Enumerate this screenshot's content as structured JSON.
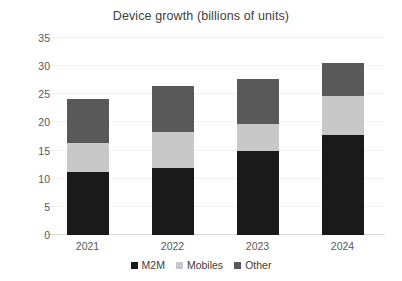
{
  "chart_data": {
    "type": "bar",
    "subtype": "stacked-column",
    "title": "Device growth (billions of units)",
    "xlabel": "",
    "ylabel": "",
    "categories": [
      "2021",
      "2022",
      "2023",
      "2024"
    ],
    "series": [
      {
        "name": "M2M",
        "color": "#1a1a1a",
        "values": [
          11.2,
          11.9,
          14.9,
          17.8
        ]
      },
      {
        "name": "Mobiles",
        "color": "#c8c8c8",
        "values": [
          5.1,
          6.4,
          4.8,
          6.9
        ]
      },
      {
        "name": "Other",
        "color": "#595959",
        "values": [
          7.9,
          8.2,
          8.0,
          5.9
        ]
      }
    ],
    "totals": [
      24.2,
      26.5,
      27.7,
      30.6
    ],
    "ylim": [
      0,
      35
    ],
    "yticks": [
      "0",
      "5",
      "10",
      "15",
      "20",
      "25",
      "30",
      "35"
    ],
    "ytick_values": [
      0,
      5,
      10,
      15,
      20,
      25,
      30,
      35
    ],
    "grid": true,
    "legend_position": "bottom",
    "legend_entries": [
      "M2M",
      "Mobiles",
      "Other"
    ]
  },
  "colors": {
    "m2m": "#1a1a1a",
    "mobiles": "#c8c8c8",
    "other": "#595959",
    "text": "#404040",
    "axis": "#d9d9d9",
    "grid": "#f2f2f2",
    "background": "#ffffff"
  }
}
